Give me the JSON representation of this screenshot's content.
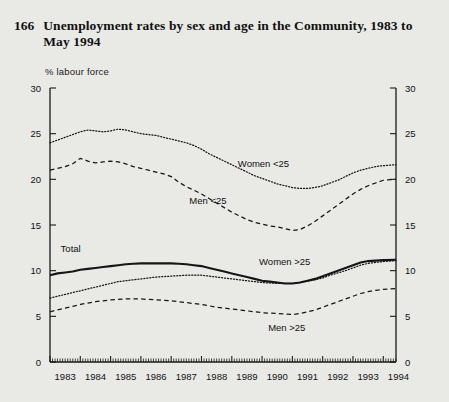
{
  "figure": {
    "number": "166",
    "title": "Unemployment rates by sex and age in the Community, 1983 to May 1994"
  },
  "chart_data": {
    "type": "line",
    "title": "Unemployment rates by sex and age in the Community, 1983 to May 1994",
    "xlabel": "",
    "ylabel": "% labour force",
    "ylim": [
      0,
      30
    ],
    "xlim": [
      1983,
      1994.42
    ],
    "yticks": [
      0,
      5,
      10,
      15,
      20,
      25,
      30
    ],
    "xticks": [
      "1983",
      "1984",
      "1985",
      "1986",
      "1987",
      "1988",
      "1989",
      "1990",
      "1991",
      "1992",
      "1993",
      "1994"
    ],
    "grid": false,
    "legend_position": "inline-annotations",
    "minor_ticks": "monthly",
    "right_axis_mirror": true,
    "x": [
      1983.0,
      1983.25,
      1983.5,
      1983.75,
      1984.0,
      1984.25,
      1984.5,
      1984.75,
      1985.0,
      1985.25,
      1985.5,
      1985.75,
      1986.0,
      1986.25,
      1986.5,
      1986.75,
      1987.0,
      1987.25,
      1987.5,
      1987.75,
      1988.0,
      1988.25,
      1988.5,
      1988.75,
      1989.0,
      1989.25,
      1989.5,
      1989.75,
      1990.0,
      1990.25,
      1990.5,
      1990.75,
      1991.0,
      1991.25,
      1991.5,
      1991.75,
      1992.0,
      1992.25,
      1992.5,
      1992.75,
      1993.0,
      1993.25,
      1993.5,
      1993.75,
      1994.0,
      1994.42
    ],
    "series": [
      {
        "name": "Women <25",
        "style": "dotted",
        "values": [
          24.0,
          24.3,
          24.6,
          24.9,
          25.2,
          25.4,
          25.3,
          25.2,
          25.3,
          25.5,
          25.4,
          25.2,
          25.0,
          24.9,
          24.8,
          24.6,
          24.4,
          24.2,
          24.0,
          23.7,
          23.3,
          22.8,
          22.4,
          22.0,
          21.6,
          21.2,
          20.8,
          20.4,
          20.1,
          19.8,
          19.5,
          19.3,
          19.1,
          19.0,
          19.0,
          19.1,
          19.3,
          19.6,
          19.9,
          20.3,
          20.7,
          21.0,
          21.2,
          21.4,
          21.5,
          21.6
        ]
      },
      {
        "name": "Men <25",
        "style": "dashed",
        "values": [
          21.0,
          21.2,
          21.4,
          21.7,
          22.3,
          22.0,
          21.8,
          21.9,
          22.0,
          21.9,
          21.7,
          21.4,
          21.2,
          21.0,
          20.8,
          20.6,
          20.3,
          19.7,
          19.2,
          18.8,
          18.4,
          17.9,
          17.4,
          16.9,
          16.4,
          16.0,
          15.6,
          15.3,
          15.1,
          14.9,
          14.8,
          14.6,
          14.4,
          14.5,
          14.9,
          15.4,
          16.0,
          16.6,
          17.2,
          17.8,
          18.4,
          18.9,
          19.3,
          19.6,
          19.9,
          20.0
        ]
      },
      {
        "name": "Total",
        "style": "solid",
        "values": [
          9.5,
          9.7,
          9.8,
          9.9,
          10.1,
          10.2,
          10.3,
          10.4,
          10.5,
          10.6,
          10.7,
          10.75,
          10.8,
          10.8,
          10.8,
          10.8,
          10.8,
          10.75,
          10.7,
          10.6,
          10.5,
          10.3,
          10.1,
          9.9,
          9.7,
          9.5,
          9.3,
          9.1,
          8.9,
          8.8,
          8.7,
          8.6,
          8.6,
          8.7,
          8.9,
          9.1,
          9.4,
          9.7,
          10.0,
          10.3,
          10.6,
          10.9,
          11.05,
          11.1,
          11.15,
          11.2
        ]
      },
      {
        "name": "Women >25",
        "style": "dotted",
        "values": [
          7.0,
          7.2,
          7.4,
          7.6,
          7.8,
          8.0,
          8.2,
          8.4,
          8.6,
          8.8,
          8.9,
          9.0,
          9.1,
          9.2,
          9.3,
          9.35,
          9.4,
          9.45,
          9.5,
          9.5,
          9.5,
          9.4,
          9.3,
          9.2,
          9.1,
          9.0,
          8.9,
          8.8,
          8.7,
          8.65,
          8.6,
          8.6,
          8.6,
          8.7,
          8.85,
          9.0,
          9.2,
          9.5,
          9.75,
          10.0,
          10.3,
          10.6,
          10.8,
          10.9,
          11.0,
          11.1
        ]
      },
      {
        "name": "Men >25",
        "style": "dashed",
        "values": [
          5.5,
          5.7,
          5.9,
          6.1,
          6.3,
          6.45,
          6.6,
          6.7,
          6.8,
          6.85,
          6.9,
          6.9,
          6.9,
          6.85,
          6.8,
          6.75,
          6.7,
          6.6,
          6.5,
          6.4,
          6.3,
          6.15,
          6.0,
          5.9,
          5.8,
          5.7,
          5.6,
          5.5,
          5.4,
          5.35,
          5.3,
          5.25,
          5.2,
          5.3,
          5.5,
          5.7,
          6.0,
          6.3,
          6.6,
          6.9,
          7.2,
          7.5,
          7.7,
          7.85,
          7.95,
          8.05
        ]
      }
    ],
    "annotations": [
      {
        "text": "Women <25",
        "x": 1989.2,
        "y": 21.4
      },
      {
        "text": "Men <25",
        "x": 1987.6,
        "y": 17.3
      },
      {
        "text": "Total",
        "x": 1983.35,
        "y": 12.0
      },
      {
        "text": "Women >25",
        "x": 1989.9,
        "y": 10.6
      },
      {
        "text": "Men >25",
        "x": 1990.2,
        "y": 3.4
      }
    ]
  }
}
